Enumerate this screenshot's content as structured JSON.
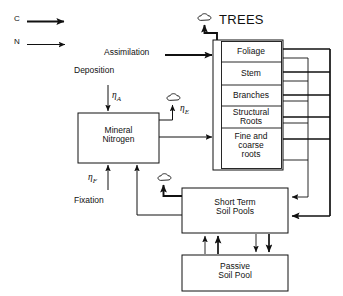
{
  "figure": {
    "title": "TREES",
    "legend": [
      {
        "key": "C",
        "label": "C",
        "icon": "thick-arrow-icon"
      },
      {
        "key": "N",
        "label": "N",
        "icon": "thin-arrow-icon"
      }
    ],
    "flows": {
      "assimilation": "Assimilation",
      "deposition": "Deposition",
      "fixation": "Fixation"
    },
    "coefficients": {
      "deposition": {
        "symbol": "η",
        "subscript": "A"
      },
      "emission": {
        "symbol": "η",
        "subscript": "E"
      },
      "fixation": {
        "symbol": "η",
        "subscript": "F"
      }
    },
    "boxes": {
      "mineral_nitrogen": {
        "line1": "Mineral",
        "line2": "Nitrogen"
      },
      "short_term_soil_pools": {
        "line1": "Short Term",
        "line2": "Soil Pools"
      },
      "passive_soil_pool": {
        "line1": "Passive",
        "line2": "Soil Pool"
      }
    },
    "tree_compartments": [
      {
        "line1": "Foliage",
        "line2": ""
      },
      {
        "line1": "Stem",
        "line2": ""
      },
      {
        "line1": "Branches",
        "line2": ""
      },
      {
        "line1": "Structural",
        "line2": "Roots"
      },
      {
        "line1": "Fine and",
        "line2": "coarse",
        "line3": "roots"
      }
    ],
    "icons": {
      "respiration_cloud": "cloud-icon"
    },
    "colors": {
      "stroke": "#111111",
      "background": "#ffffff"
    }
  }
}
